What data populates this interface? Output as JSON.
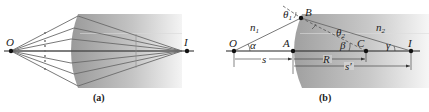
{
  "figure": {
    "panel_a": {
      "caption": "(a)",
      "labels": {
        "object": "O",
        "image": "I"
      },
      "ray_count": 7
    },
    "panel_b": {
      "caption": "(b)",
      "labels": {
        "object": "O",
        "vertex": "A",
        "surface_point": "B",
        "center": "C",
        "image": "I",
        "n1": "n",
        "n1_sub": "1",
        "n2": "n",
        "n2_sub": "2",
        "alpha": "α",
        "beta": "β",
        "gamma": "γ",
        "theta1": "θ",
        "theta1_sub": "1",
        "theta2": "θ",
        "theta2_sub": "2",
        "s": "s",
        "R": "R",
        "s_prime": "s′"
      }
    },
    "colors": {
      "medium_dark": "#9a9a9a",
      "medium_light": "#f2f2f2",
      "ray": "#6a6a6a",
      "axis": "#222222"
    }
  }
}
